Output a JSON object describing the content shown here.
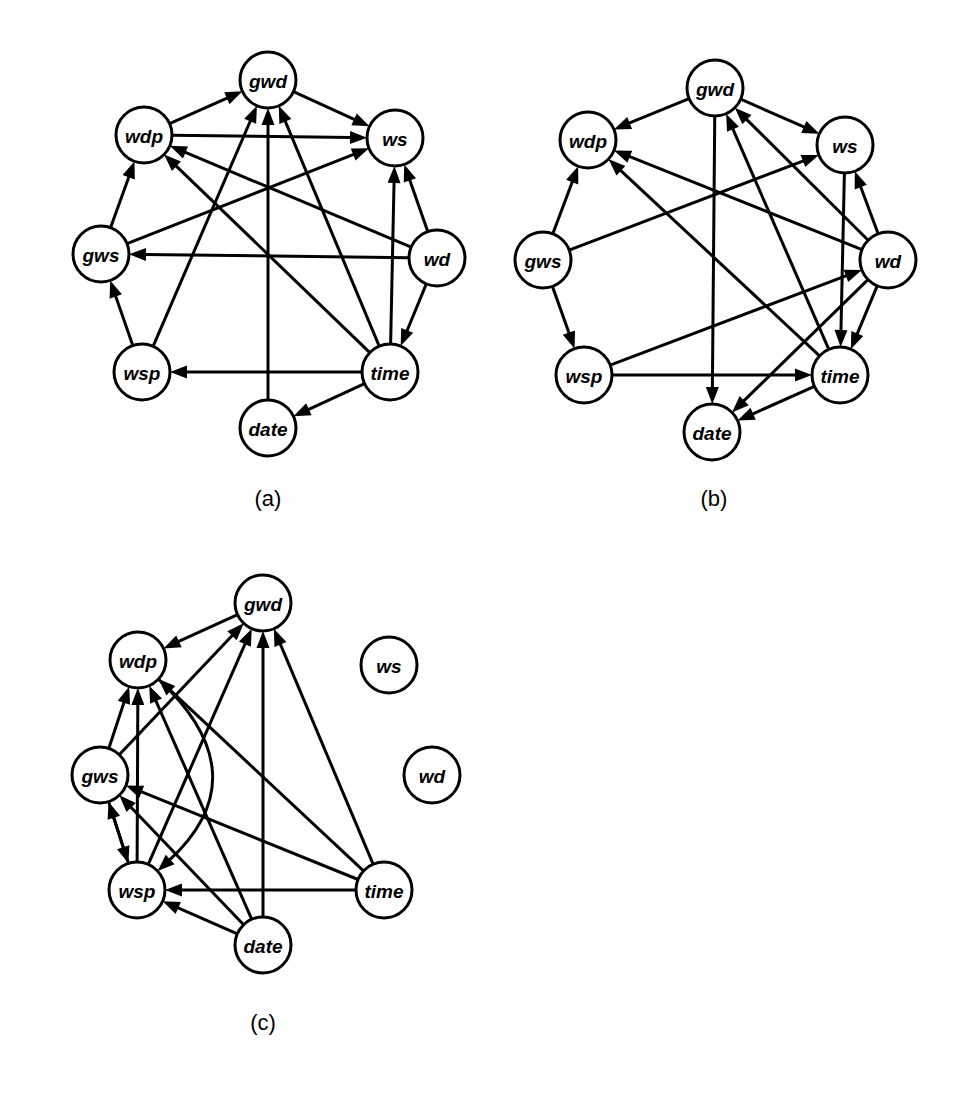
{
  "figure": {
    "title": "",
    "background_color": "#ffffff",
    "stroke_color": "#000000",
    "node_fill_color": "#ffffff",
    "width": 959,
    "height": 1095
  },
  "panels": [
    {
      "id": "a",
      "caption": "(a)",
      "caption_pos": [
        268,
        498
      ],
      "node_radius": 28,
      "nodes": [
        {
          "id": "gwd",
          "label": "gwd",
          "x": 268,
          "y": 80
        },
        {
          "id": "wdp",
          "label": "wdp",
          "x": 144,
          "y": 135
        },
        {
          "id": "ws",
          "label": "ws",
          "x": 395,
          "y": 138
        },
        {
          "id": "gws",
          "label": "gws",
          "x": 101,
          "y": 254
        },
        {
          "id": "wd",
          "label": "wd",
          "x": 437,
          "y": 258
        },
        {
          "id": "wsp",
          "label": "wsp",
          "x": 142,
          "y": 372
        },
        {
          "id": "time",
          "label": "time",
          "x": 390,
          "y": 372
        },
        {
          "id": "date",
          "label": "date",
          "x": 268,
          "y": 428
        }
      ],
      "edges": [
        {
          "from": "wdp",
          "to": "gwd"
        },
        {
          "from": "wdp",
          "to": "ws"
        },
        {
          "from": "gwd",
          "to": "ws"
        },
        {
          "from": "gws",
          "to": "wdp"
        },
        {
          "from": "gws",
          "to": "ws"
        },
        {
          "from": "wsp",
          "to": "gws"
        },
        {
          "from": "wsp",
          "to": "gwd"
        },
        {
          "from": "wd",
          "to": "ws"
        },
        {
          "from": "wd",
          "to": "wdp"
        },
        {
          "from": "wd",
          "to": "gws"
        },
        {
          "from": "wd",
          "to": "time"
        },
        {
          "from": "time",
          "to": "ws"
        },
        {
          "from": "time",
          "to": "gwd"
        },
        {
          "from": "time",
          "to": "wdp"
        },
        {
          "from": "time",
          "to": "wsp"
        },
        {
          "from": "time",
          "to": "date"
        },
        {
          "from": "date",
          "to": "gwd"
        }
      ]
    },
    {
      "id": "b",
      "caption": "(b)",
      "caption_pos": [
        714,
        498
      ],
      "node_radius": 28,
      "nodes": [
        {
          "id": "gwd",
          "label": "gwd",
          "x": 715,
          "y": 88
        },
        {
          "id": "wdp",
          "label": "wdp",
          "x": 588,
          "y": 140
        },
        {
          "id": "ws",
          "label": "ws",
          "x": 845,
          "y": 145
        },
        {
          "id": "gws",
          "label": "gws",
          "x": 543,
          "y": 260
        },
        {
          "id": "wd",
          "label": "wd",
          "x": 888,
          "y": 260
        },
        {
          "id": "wsp",
          "label": "wsp",
          "x": 584,
          "y": 375
        },
        {
          "id": "time",
          "label": "time",
          "x": 840,
          "y": 375
        },
        {
          "id": "date",
          "label": "date",
          "x": 712,
          "y": 432
        }
      ],
      "edges": [
        {
          "from": "gwd",
          "to": "wdp"
        },
        {
          "from": "gwd",
          "to": "ws"
        },
        {
          "from": "gwd",
          "to": "date"
        },
        {
          "from": "gws",
          "to": "wdp"
        },
        {
          "from": "gws",
          "to": "wsp"
        },
        {
          "from": "gws",
          "to": "ws"
        },
        {
          "from": "wd",
          "to": "wdp"
        },
        {
          "from": "wd",
          "to": "gwd"
        },
        {
          "from": "wd",
          "to": "ws"
        },
        {
          "from": "wd",
          "to": "time"
        },
        {
          "from": "wd",
          "to": "date"
        },
        {
          "from": "ws",
          "to": "time"
        },
        {
          "from": "wsp",
          "to": "time"
        },
        {
          "from": "wsp",
          "to": "wd"
        },
        {
          "from": "time",
          "to": "date"
        },
        {
          "from": "time",
          "to": "wdp"
        },
        {
          "from": "time",
          "to": "gwd"
        }
      ]
    },
    {
      "id": "c",
      "caption": "(c)",
      "caption_pos": [
        263,
        1022
      ],
      "node_radius": 28,
      "nodes": [
        {
          "id": "gwd",
          "label": "gwd",
          "x": 263,
          "y": 603
        },
        {
          "id": "wdp",
          "label": "wdp",
          "x": 138,
          "y": 660
        },
        {
          "id": "ws",
          "label": "ws",
          "x": 389,
          "y": 665
        },
        {
          "id": "gws",
          "label": "gws",
          "x": 100,
          "y": 775
        },
        {
          "id": "wd",
          "label": "wd",
          "x": 432,
          "y": 775
        },
        {
          "id": "wsp",
          "label": "wsp",
          "x": 137,
          "y": 890
        },
        {
          "id": "time",
          "label": "time",
          "x": 384,
          "y": 890
        },
        {
          "id": "date",
          "label": "date",
          "x": 263,
          "y": 945
        }
      ],
      "edges": [
        {
          "from": "gwd",
          "to": "wdp"
        },
        {
          "from": "gws",
          "to": "wdp"
        },
        {
          "from": "gws",
          "to": "wsp"
        },
        {
          "from": "gws",
          "to": "gwd"
        },
        {
          "from": "wsp",
          "to": "gws"
        },
        {
          "from": "wsp",
          "to": "wdp"
        },
        {
          "from": "wsp",
          "to": "gwd"
        },
        {
          "from": "wdp",
          "to": "wsp",
          "curve": -62
        },
        {
          "from": "date",
          "to": "wdp"
        },
        {
          "from": "date",
          "to": "gws"
        },
        {
          "from": "date",
          "to": "wsp"
        },
        {
          "from": "date",
          "to": "gwd"
        },
        {
          "from": "time",
          "to": "wdp"
        },
        {
          "from": "time",
          "to": "gws"
        },
        {
          "from": "time",
          "to": "wsp"
        },
        {
          "from": "time",
          "to": "gwd"
        }
      ],
      "isolated_nodes": [
        "ws",
        "wd"
      ]
    }
  ],
  "node_names": [
    "gwd",
    "wdp",
    "ws",
    "gws",
    "wd",
    "wsp",
    "time",
    "date"
  ]
}
